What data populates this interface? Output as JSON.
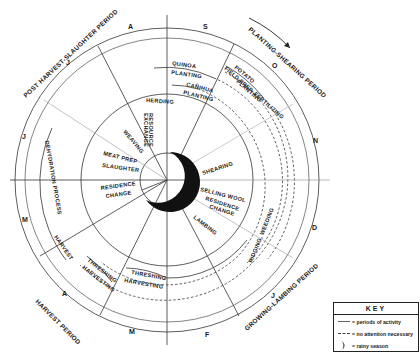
{
  "diagram": {
    "type": "circular seasonal activity calendar",
    "center": [
      167,
      180
    ],
    "months": [
      {
        "label": "S",
        "x": 203,
        "y": 29
      },
      {
        "label": "O",
        "x": 272,
        "y": 68
      },
      {
        "label": "N",
        "x": 313,
        "y": 143
      },
      {
        "label": "D",
        "x": 312,
        "y": 230
      },
      {
        "label": "J",
        "x": 271,
        "y": 298
      },
      {
        "label": "F",
        "x": 205,
        "y": 337
      },
      {
        "label": "M",
        "x": 129,
        "y": 334
      },
      {
        "label": "A",
        "x": 62,
        "y": 296
      },
      {
        "label": "M",
        "x": 22,
        "y": 222
      },
      {
        "label": "J",
        "x": 22,
        "y": 139
      },
      {
        "label": "J",
        "x": 66,
        "y": 65
      },
      {
        "label": "A",
        "x": 128,
        "y": 29
      }
    ],
    "periods": [
      {
        "label": "PLANTING-SHEARING PERIOD",
        "x": 248,
        "y": 30,
        "rotate": 42
      },
      {
        "label": "GROWING-LAMBING PERIOD",
        "x": 247,
        "y": 331,
        "rotate": -42
      },
      {
        "label": "HARVEST PERIOD",
        "x": 35,
        "y": 302,
        "rotate": 45
      },
      {
        "label": "POST HARVEST-SLAUGHTER PERIOD",
        "x": 26,
        "y": 98,
        "rotate": -43
      }
    ],
    "activities": [
      {
        "label": "QUINOA",
        "x": 172,
        "y": 65,
        "rotate": 8
      },
      {
        "label": "PLANTING",
        "x": 171,
        "y": 74,
        "rotate": 8
      },
      {
        "label": "CAÑIHUA",
        "x": 186,
        "y": 86,
        "rotate": 14
      },
      {
        "label": "PLANTING",
        "x": 183,
        "y": 94,
        "rotate": 14
      },
      {
        "label": "POTATO",
        "x": 234,
        "y": 68,
        "rotate": 40
      },
      {
        "label": "FIELD PREP. FERTILIZING",
        "x": 224,
        "y": 69,
        "rotate": 41
      },
      {
        "label": "PLANTING",
        "x": 236,
        "y": 82,
        "rotate": 41
      },
      {
        "label": "HERDING",
        "x": 146,
        "y": 102,
        "rotate": 4
      },
      {
        "label": "RESOURCE",
        "x": 149,
        "y": 113,
        "rotate": 90
      },
      {
        "label": "EXCHANGE",
        "x": 144,
        "y": 113,
        "rotate": 90
      },
      {
        "label": "WEAVING",
        "x": 123,
        "y": 132,
        "rotate": 50
      },
      {
        "label": "MEAT PREP",
        "x": 103,
        "y": 155,
        "rotate": 14
      },
      {
        "label": "SLAUGHTER",
        "x": 102,
        "y": 167,
        "rotate": 8
      },
      {
        "label": "SHEARING",
        "x": 203,
        "y": 175,
        "rotate": -18
      },
      {
        "label": "SELLING WOOL",
        "x": 200,
        "y": 191,
        "rotate": 14
      },
      {
        "label": "RESIDENCE",
        "x": 205,
        "y": 200,
        "rotate": 18
      },
      {
        "label": "CHANGE",
        "x": 209,
        "y": 208,
        "rotate": 18
      },
      {
        "label": "LAMBING",
        "x": 193,
        "y": 218,
        "rotate": 38
      },
      {
        "label": "RESIDENCE",
        "x": 101,
        "y": 190,
        "rotate": -8
      },
      {
        "label": "CHANGE",
        "x": 106,
        "y": 198,
        "rotate": -8
      },
      {
        "label": "DEHYDRATION PROCESS",
        "x": 45,
        "y": 141,
        "rotate": 80
      },
      {
        "label": "HARVEST",
        "x": 54,
        "y": 237,
        "rotate": 55
      },
      {
        "label": "THRESHING",
        "x": 87,
        "y": 261,
        "rotate": 38
      },
      {
        "label": "HARVESTING",
        "x": 82,
        "y": 268,
        "rotate": 38
      },
      {
        "label": "THRESHING",
        "x": 131,
        "y": 274,
        "rotate": 10
      },
      {
        "label": "HARVESTING",
        "x": 124,
        "y": 282,
        "rotate": 10
      },
      {
        "label": "RIDGING, WEEDING",
        "x": 252,
        "y": 263,
        "rotate": -68
      }
    ]
  },
  "key": {
    "title": "KEY",
    "items": [
      {
        "symbol": "solid-line",
        "label": "= periods of activity"
      },
      {
        "symbol": "dashed-line",
        "label": "= no attention necessary"
      },
      {
        "symbol": "crescent",
        "label": "= rainy season"
      }
    ]
  },
  "colors": {
    "ink": "#1a1a1a",
    "faint": "#9a9a9a",
    "paper": "#ffffff"
  }
}
